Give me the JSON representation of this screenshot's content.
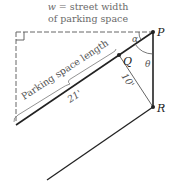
{
  "caption": {
    "var": "w",
    "line1_rest": " = street width",
    "line2": "of parking space"
  },
  "labels": {
    "parking_space_length": "Parking space length",
    "length_value": "21'",
    "width_value": "10'",
    "point_P": "P",
    "point_Q": "Q",
    "point_R": "R",
    "angle_alpha": "α",
    "angle_theta": "θ"
  },
  "colors": {
    "line": "#222222",
    "thin_line": "#555555",
    "dashed": "#666666",
    "text": "#555555"
  }
}
